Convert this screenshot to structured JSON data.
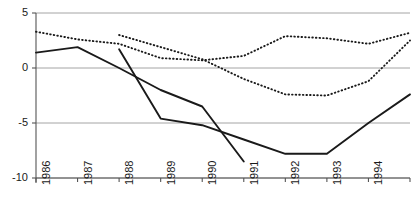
{
  "chart_data": {
    "type": "line",
    "title": "",
    "subtitle": "",
    "xlabel": "",
    "ylabel": "",
    "categories": [
      "1986",
      "1987",
      "1988",
      "1989",
      "1990",
      "1991",
      "1992",
      "1993",
      "1994",
      "1995"
    ],
    "xtick_labels": [
      "1986",
      "1987",
      "1988",
      "1989",
      "1990",
      "1991",
      "1992",
      "1993",
      "1994",
      "1995"
    ],
    "ytick_labels": [
      "5",
      "0",
      "-5",
      "-10"
    ],
    "ytick_values": [
      5,
      0,
      -5,
      -10
    ],
    "ylim": [
      -10,
      5
    ],
    "xlim": [
      "1986",
      "1995"
    ],
    "grid": true,
    "grid_axis": "y",
    "legend": "none",
    "legend_position": "none",
    "series": [
      {
        "name": "series-1",
        "style": "dotted",
        "color": "#1a1a1a",
        "x": [
          "1986",
          "1987",
          "1988",
          "1989",
          "1990",
          "1991",
          "1992",
          "1993",
          "1994",
          "1995"
        ],
        "values": [
          3.3,
          2.6,
          2.2,
          0.9,
          0.7,
          1.1,
          2.9,
          2.7,
          2.2,
          3.2
        ]
      },
      {
        "name": "series-2",
        "style": "dotted",
        "color": "#1a1a1a",
        "x": [
          "1988",
          "1989",
          "1990",
          "1991",
          "1992",
          "1993",
          "1994",
          "1995"
        ],
        "values": [
          3.0,
          1.9,
          0.8,
          -1.0,
          -2.4,
          -2.5,
          -1.2,
          2.5
        ]
      },
      {
        "name": "series-3",
        "style": "solid",
        "color": "#1a1a1a",
        "x": [
          "1986",
          "1987",
          "1988",
          "1989",
          "1990",
          "1991"
        ],
        "values": [
          1.4,
          1.9,
          0.0,
          -2.0,
          -3.5,
          -8.5
        ]
      },
      {
        "name": "series-4",
        "style": "solid",
        "color": "#1a1a1a",
        "x": [
          "1988",
          "1989",
          "1990",
          "1991",
          "1992",
          "1993",
          "1994",
          "1995"
        ],
        "values": [
          1.7,
          -4.6,
          -5.2,
          -6.5,
          -7.8,
          -7.8,
          -5.0,
          -2.4
        ]
      }
    ]
  },
  "axis_colors": {
    "axis_line": "#555555",
    "grid_line": "#9a9a9a",
    "text": "#1a1a1a"
  }
}
